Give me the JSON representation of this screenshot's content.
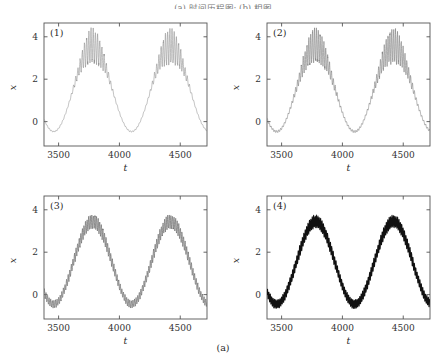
{
  "header": {
    "text": "(a) 时间历程图; (b) 相图"
  },
  "caption": {
    "label": "(a)"
  },
  "axes": {
    "xlabel": "t",
    "ylabel": "x",
    "xticks": [
      3500,
      4000,
      4500
    ],
    "yticks": [
      0,
      2,
      4
    ],
    "xlim": [
      3380,
      4720
    ],
    "ylim": [
      -1.15,
      4.65
    ]
  },
  "chart_data": [
    {
      "type": "line",
      "title": "(1)",
      "xlabel": "t",
      "ylabel": "x",
      "xlim": [
        3380,
        4720
      ],
      "ylim": [
        -1.15,
        4.65
      ],
      "xticks": [
        3500,
        4000,
        4500
      ],
      "yticks": [
        0,
        2,
        4
      ],
      "grid": false,
      "legend": "none",
      "line_color": "#8a8a8a",
      "line_width": 0.55,
      "series": [
        {
          "name": "x(t)",
          "slow_offset": 1.55,
          "slow_amplitude": 2.02,
          "slow_period": 640,
          "slow_peak_t": 3780,
          "fast_period": 18.0,
          "fast_amplitude": 0.78,
          "fast_floor": 0.035,
          "fast_envelope_exponent": 3.4,
          "peak_value": 4.25,
          "trough_value": -0.62,
          "peak_times": [
            3780,
            4420
          ],
          "trough_times": [
            3450,
            4095,
            4700
          ]
        }
      ]
    },
    {
      "type": "line",
      "title": "(2)",
      "xlabel": "t",
      "ylabel": "x",
      "xlim": [
        3380,
        4720
      ],
      "ylim": [
        -1.15,
        4.65
      ],
      "xticks": [
        3500,
        4000,
        4500
      ],
      "yticks": [
        0,
        2,
        4
      ],
      "grid": false,
      "legend": "none",
      "line_color": "#7e7e7e",
      "line_width": 0.6,
      "series": [
        {
          "name": "x(t)",
          "slow_offset": 1.55,
          "slow_amplitude": 2.02,
          "slow_period": 640,
          "slow_peak_t": 3780,
          "fast_period": 15.5,
          "fast_amplitude": 0.74,
          "fast_floor": 0.07,
          "fast_envelope_exponent": 2.6,
          "peak_value": 4.25,
          "trough_value": -0.66,
          "peak_times": [
            3780,
            4420
          ],
          "trough_times": [
            3450,
            4095,
            4700
          ]
        }
      ]
    },
    {
      "type": "line",
      "title": "(3)",
      "xlabel": "t",
      "ylabel": "x",
      "xlim": [
        3380,
        4720
      ],
      "ylim": [
        -1.15,
        4.65
      ],
      "xticks": [
        3500,
        4000,
        4500
      ],
      "yticks": [
        0,
        2,
        4
      ],
      "grid": false,
      "legend": "none",
      "line_color": "#6e6e6e",
      "line_width": 0.7,
      "series": [
        {
          "name": "x(t)",
          "slow_offset": 1.5,
          "slow_amplitude": 1.95,
          "slow_period": 640,
          "slow_peak_t": 3780,
          "fast_period": 13.0,
          "fast_amplitude": 0.3,
          "fast_floor": 0.55,
          "fast_envelope_exponent": 1.3,
          "peak_value": 3.92,
          "trough_value": -0.8,
          "peak_times": [
            3780,
            4420
          ],
          "trough_times": [
            3450,
            4095,
            4700
          ]
        }
      ]
    },
    {
      "type": "line",
      "title": "(4)",
      "xlabel": "t",
      "ylabel": "x",
      "xlim": [
        3380,
        4720
      ],
      "ylim": [
        -1.15,
        4.65
      ],
      "xticks": [
        3500,
        4000,
        4500
      ],
      "yticks": [
        0,
        2,
        4
      ],
      "grid": false,
      "legend": "none",
      "line_color": "#111111",
      "line_width": 1.05,
      "series": [
        {
          "name": "x(t)",
          "slow_offset": 1.5,
          "slow_amplitude": 1.95,
          "slow_period": 640,
          "slow_peak_t": 3780,
          "fast_period": 11.5,
          "fast_amplitude": 0.27,
          "fast_floor": 0.72,
          "fast_envelope_exponent": 1.0,
          "peak_value": 3.88,
          "trough_value": -0.82,
          "peak_times": [
            3780,
            4420
          ],
          "trough_times": [
            3450,
            4095,
            4700
          ]
        }
      ]
    }
  ]
}
